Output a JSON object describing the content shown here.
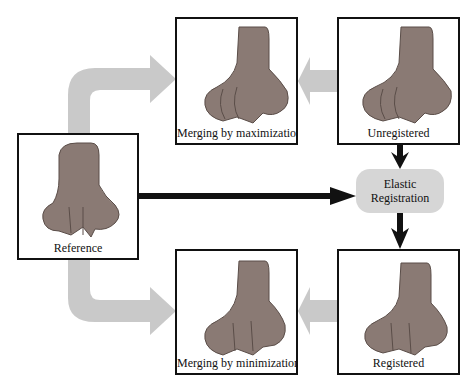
{
  "diagram": {
    "panels": [
      {
        "id": "reference",
        "caption": "Reference"
      },
      {
        "id": "merge-max",
        "caption": "Merging by maximization"
      },
      {
        "id": "unregistered",
        "caption": "Unregistered"
      },
      {
        "id": "merge-min",
        "caption": "Merging by minimization"
      },
      {
        "id": "registered",
        "caption": "Registered"
      }
    ],
    "process": {
      "line1": "Elastic",
      "line2": "Registration"
    },
    "colors": {
      "gray_arrow": "#c4c4c4",
      "black_arrow": "#111111",
      "pill": "#d6d6d6",
      "bone": "#8a7a74"
    }
  }
}
